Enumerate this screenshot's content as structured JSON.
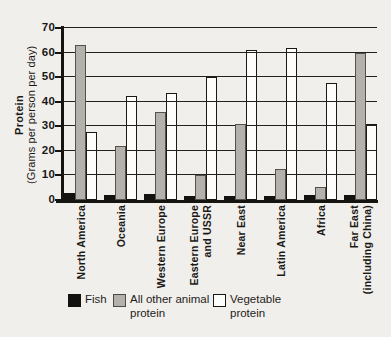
{
  "y_axis": {
    "title_bold": "Protein",
    "title_sub": "(Grams per person per day)",
    "tick_values": [
      0,
      10,
      20,
      30,
      40,
      50,
      60,
      70
    ]
  },
  "legend": [
    {
      "key": "fish",
      "label": "Fish"
    },
    {
      "key": "animal",
      "label": "All other animal\nprotein"
    },
    {
      "key": "veg",
      "label": "Vegetable\nprotein"
    }
  ],
  "colors": {
    "fish": "#131210",
    "animal": "#b4b1ac",
    "vegetable": "#fdfdfb",
    "axis": "#151411",
    "paper": "#f1efec"
  },
  "chart_data": {
    "type": "bar",
    "title": "",
    "xlabel": "",
    "ylabel": "Protein (Grams per person per day)",
    "ylim": [
      0,
      70
    ],
    "ytick_step": 10,
    "grid": true,
    "legend_position": "bottom",
    "categories": [
      "North America",
      "Oceania",
      "Western Europe",
      "Eastern Europe\nand USSR",
      "Near East",
      "Latin America",
      "Africa",
      "Far East\n(including China)"
    ],
    "series": [
      {
        "name": "Fish",
        "key": "fish",
        "values": [
          3,
          2,
          2.5,
          1.5,
          1.5,
          1.5,
          2,
          2
        ]
      },
      {
        "name": "All other animal protein",
        "key": "animal",
        "values": [
          63,
          22,
          36,
          10,
          31,
          12.5,
          5.5,
          60
        ]
      },
      {
        "name": "Vegetable protein",
        "key": "veg",
        "values": [
          27.5,
          42.5,
          43.5,
          50,
          61,
          62,
          47.5,
          31
        ]
      }
    ]
  }
}
